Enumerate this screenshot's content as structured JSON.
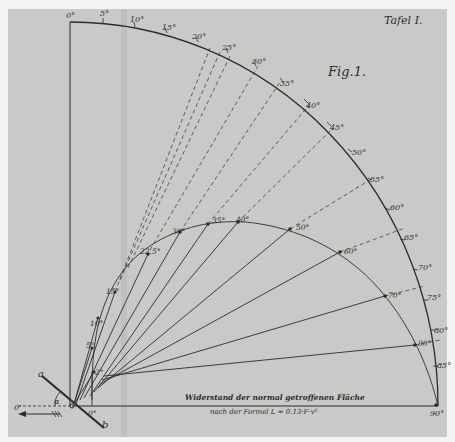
{
  "plate": {
    "title": "Tafel I.",
    "figure_label": "Fig.1.",
    "background_color": "#c9cac7",
    "ink_color": "#2c2c2c"
  },
  "caption": {
    "line1": "Widerstand der normal getroffenen Fläche",
    "line2": "nach der Formel L = 0.13·F·v²"
  },
  "outer_scale": {
    "labels": [
      "0°",
      "5°",
      "10°",
      "15°",
      "20°",
      "25°",
      "30°",
      "35°",
      "40°",
      "45°",
      "50°",
      "55°",
      "60°",
      "65°",
      "70°",
      "75°",
      "80°",
      "85°",
      "90°"
    ]
  },
  "inner_curve": {
    "labels": [
      "0°",
      "2°",
      "5°",
      "10°",
      "15°",
      "22.5°",
      "30°",
      "35°",
      "40°",
      "50°",
      "60°",
      "70°",
      "80°",
      "90°"
    ]
  },
  "plane_diagram": {
    "end_a": "a",
    "end_b": "b",
    "angle": "α",
    "point": "C",
    "origin_label": "0'",
    "base_label": "0°"
  }
}
